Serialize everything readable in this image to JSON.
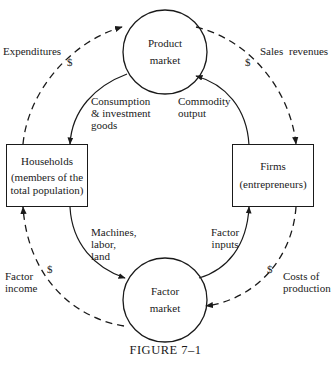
{
  "figure": {
    "caption": "FIGURE 7–1",
    "nodes": {
      "product_market": {
        "line1": "Product",
        "line2": "market"
      },
      "factor_market": {
        "line1": "Factor",
        "line2": "market"
      },
      "households": {
        "line1": "Households",
        "line2": "(members of the",
        "line3": "total population)"
      },
      "firms": {
        "line1": "Firms",
        "line2": "(entrepreneurs)"
      }
    },
    "real_flows": {
      "consumption": {
        "line1": "Consumption",
        "line2": "& investment",
        "line3": "goods"
      },
      "commodity_output": {
        "line1": "Commodity",
        "line2": "output"
      },
      "machines": {
        "line1": "Machines,",
        "line2": "labor,",
        "line3": "land"
      },
      "factor_inputs": {
        "line1": "Factor",
        "line2": "inputs"
      }
    },
    "money_flows": {
      "expenditures": "Expenditures",
      "sales_revenues": "Sales  revenues",
      "factor_income": {
        "line1": "Factor",
        "line2": "income"
      },
      "costs_of_production": {
        "line1": "Costs of",
        "line2": "production"
      },
      "currency_symbol": "$"
    },
    "colors": {
      "ink": "#1a1a1a",
      "background": "#ffffff"
    }
  }
}
